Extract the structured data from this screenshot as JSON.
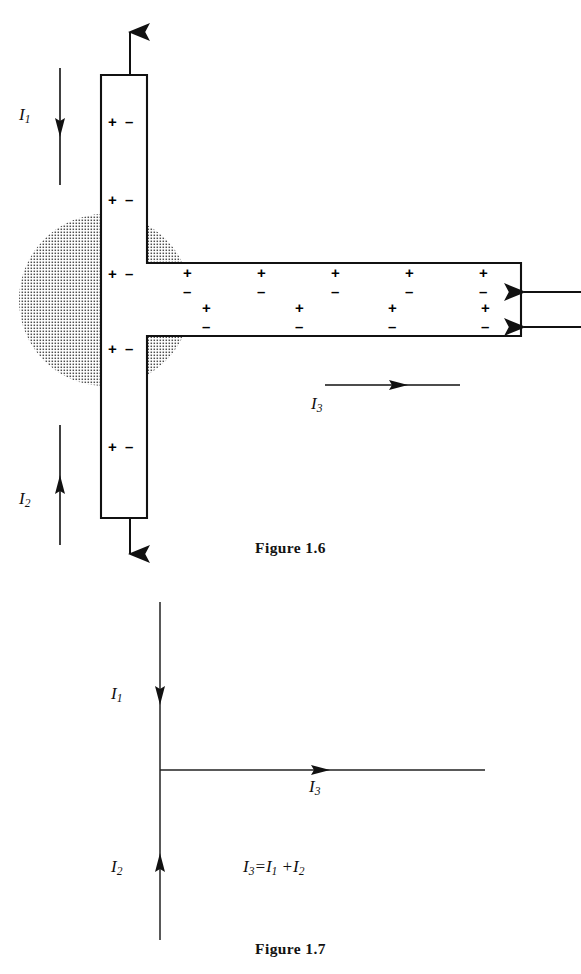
{
  "page": {
    "background_color": "#ffffff",
    "ink_color": "#111111",
    "width": 581,
    "height": 974
  },
  "figures": [
    {
      "id": "figure-1-6",
      "caption": "Figure 1.6",
      "description": "T-shaped conductor junction with surface charge pairs and a dotted spherical charge region at the junction",
      "conductor": {
        "fill": "#ffffff",
        "stroke": "#111111",
        "vertical_arm": {
          "x": 101,
          "y": 75,
          "width": 46,
          "height": 443
        },
        "horizontal_arm": {
          "x": 147,
          "y": 263,
          "width": 374,
          "height": 73
        }
      },
      "charge_region": {
        "name": "dotted-charge-cloud",
        "center_x": 105,
        "center_y": 300,
        "radius": 86,
        "pattern": "dot-screen",
        "dot_color": "#5a5a5a"
      },
      "vertical_charge_pairs": [
        {
          "plus": "+",
          "minus": "−",
          "y": 122
        },
        {
          "plus": "+",
          "minus": "−",
          "y": 200
        },
        {
          "plus": "+",
          "minus": "−",
          "y": 274
        },
        {
          "plus": "+",
          "minus": "−",
          "y": 349
        },
        {
          "plus": "+",
          "minus": "−",
          "y": 447
        }
      ],
      "horizontal_charge_pairs_upper": [
        {
          "plus": "+",
          "minus": "−",
          "x": 189
        },
        {
          "plus": "+",
          "minus": "−",
          "x": 263
        },
        {
          "plus": "+",
          "minus": "−",
          "x": 337
        },
        {
          "plus": "+",
          "minus": "−",
          "x": 411
        },
        {
          "plus": "+",
          "minus": "−",
          "x": 485
        }
      ],
      "horizontal_charge_pairs_lower": [
        {
          "plus": "+",
          "minus": "−",
          "x": 208
        },
        {
          "plus": "+",
          "minus": "−",
          "x": 301
        },
        {
          "plus": "+",
          "minus": "−",
          "x": 394
        },
        {
          "plus": "+",
          "minus": "−",
          "x": 487
        }
      ],
      "current_arrows": [
        {
          "name": "current-arrow-i1",
          "label": "I",
          "subscript": "1",
          "direction": "down",
          "x": 60,
          "y_start": 68,
          "y_end": 185
        },
        {
          "name": "current-arrow-i2",
          "label": "I",
          "subscript": "2",
          "direction": "up",
          "x": 60,
          "y_start": 545,
          "y_end": 425
        },
        {
          "name": "current-arrow-i3",
          "label": "I",
          "subscript": "3",
          "direction": "right",
          "y": 385,
          "x_start": 325,
          "x_end": 460
        },
        {
          "name": "conductor-top-arrow",
          "direction": "up",
          "x": 130,
          "y_start": 75,
          "y_end": 30
        },
        {
          "name": "conductor-bottom-arrow",
          "direction": "down",
          "x": 130,
          "y_start": 518,
          "y_end": 556
        },
        {
          "name": "field-arrow-upper",
          "direction": "left",
          "y": 292,
          "x_start": 581,
          "x_end": 523
        },
        {
          "name": "field-arrow-lower",
          "direction": "left",
          "y": 327,
          "x_start": 581,
          "x_end": 523
        }
      ]
    },
    {
      "id": "figure-1-7",
      "caption": "Figure 1.7",
      "description": "Schematic current junction showing I1 and I2 flowing into a node and I3 flowing out",
      "equation": "I3=I1 +I2",
      "equation_parts": {
        "lhs": "I",
        "lhs_sub": "3",
        "eq": "=",
        "term1": "I",
        "term1_sub": "1",
        "plus": "+",
        "term2": "I",
        "term2_sub": "2"
      },
      "node": {
        "x": 160,
        "y": 770
      },
      "current_arrows": [
        {
          "name": "current-arrow-i1",
          "label": "I",
          "subscript": "1",
          "direction": "down",
          "x": 160,
          "y_start": 602,
          "y_end": 940,
          "head_y": 700
        },
        {
          "name": "current-arrow-i2",
          "label": "I",
          "subscript": "2",
          "direction": "up",
          "x": 160,
          "y_start": 940,
          "y_end": 602,
          "head_y": 862
        },
        {
          "name": "current-arrow-i3",
          "label": "I",
          "subscript": "3",
          "direction": "right",
          "y": 770,
          "x_start": 160,
          "x_end": 485,
          "head_x": 322
        }
      ]
    }
  ]
}
